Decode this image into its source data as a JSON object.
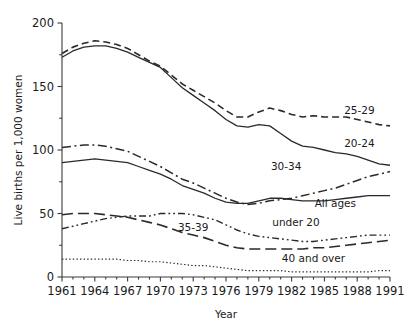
{
  "chart_data": {
    "type": "line",
    "title": "",
    "xlabel": "Year",
    "ylabel": "Live births per 1,000 women",
    "xlim": [
      1961,
      1991
    ],
    "ylim": [
      0,
      200
    ],
    "yticks": [
      0,
      50,
      100,
      150,
      200
    ],
    "ytick_labels": [
      "0",
      "50",
      "100",
      "150",
      "200"
    ],
    "xticks": [
      1961,
      1964,
      1967,
      1970,
      1973,
      1976,
      1979,
      1982,
      1985,
      1988,
      1991
    ],
    "xtick_labels": [
      "1961",
      "1964",
      "1967",
      "1970",
      "1973",
      "1976",
      "1979",
      "1982",
      "1985",
      "1988",
      "1991"
    ],
    "grid": false,
    "legend_position": "inline-end-of-line",
    "x": [
      1961,
      1962,
      1963,
      1964,
      1965,
      1966,
      1967,
      1968,
      1969,
      1970,
      1971,
      1972,
      1973,
      1974,
      1975,
      1976,
      1977,
      1978,
      1979,
      1980,
      1981,
      1982,
      1983,
      1984,
      1985,
      1986,
      1987,
      1988,
      1989,
      1990,
      1991
    ],
    "series": [
      {
        "name": "25-29",
        "label": "25-29",
        "style": "dashed",
        "dasharray": "7,4",
        "width": 1.6,
        "label_xy": [
          1988.2,
          128
        ],
        "values": [
          176,
          181,
          184,
          186,
          185,
          183,
          180,
          175,
          170,
          166,
          159,
          152,
          147,
          142,
          137,
          131,
          126,
          126,
          130,
          133,
          131,
          128,
          126,
          127,
          126,
          126,
          126,
          124,
          122,
          120,
          119
        ]
      },
      {
        "name": "20-24",
        "label": "20-24",
        "style": "solid",
        "dasharray": "none",
        "width": 1.3,
        "label_xy": [
          1988.2,
          102
        ],
        "values": [
          173,
          178,
          181,
          182,
          182,
          180,
          177,
          173,
          169,
          165,
          157,
          149,
          143,
          137,
          131,
          124,
          119,
          118,
          120,
          119,
          113,
          107,
          103,
          102,
          100,
          98,
          97,
          95,
          92,
          89,
          88
        ]
      },
      {
        "name": "30-34",
        "label": "30-34",
        "style": "dashdot",
        "dasharray": "9,3.5,2,3.5",
        "width": 1.5,
        "label_xy": [
          1981.5,
          84
        ],
        "values": [
          102,
          103,
          104,
          104,
          103,
          101,
          99,
          95,
          91,
          87,
          82,
          77,
          74,
          70,
          66,
          62,
          59,
          57,
          58,
          60,
          61,
          62,
          64,
          66,
          68,
          70,
          73,
          76,
          79,
          81,
          83
        ]
      },
      {
        "name": "All ages",
        "label": "All ages",
        "style": "solid",
        "dasharray": "none",
        "width": 1.3,
        "label_xy": [
          1986.0,
          55
        ],
        "values": [
          90,
          91,
          92,
          93,
          92,
          91,
          90,
          87,
          84,
          81,
          77,
          72,
          69,
          66,
          62,
          59,
          58,
          58,
          60,
          62,
          62,
          61,
          60,
          60,
          60,
          61,
          62,
          63,
          64,
          64,
          64
        ]
      },
      {
        "name": "under 20",
        "label": "under 20",
        "style": "dashdotdot",
        "dasharray": "7,3,1.8,3,1.8,3",
        "width": 1.4,
        "label_xy": [
          1982.4,
          40
        ],
        "values": [
          38,
          40,
          42,
          44,
          46,
          47,
          48,
          48,
          48,
          50,
          50,
          50,
          49,
          47,
          45,
          41,
          37,
          34,
          32,
          31,
          30,
          29,
          28,
          28,
          29,
          30,
          31,
          32,
          33,
          33,
          33
        ]
      },
      {
        "name": "35-39",
        "label": "35-39",
        "style": "longdash",
        "dasharray": "11,5",
        "width": 1.6,
        "label_xy": [
          1973.0,
          36
        ],
        "values": [
          49,
          50,
          50,
          50,
          49,
          48,
          47,
          45,
          43,
          41,
          38,
          35,
          33,
          31,
          28,
          25,
          23,
          22,
          22,
          22,
          22,
          22,
          22,
          23,
          23,
          24,
          25,
          26,
          27,
          28,
          29
        ]
      },
      {
        "name": "40 and over",
        "label": "40 and over",
        "style": "dotted",
        "dasharray": "1.4,2.2",
        "width": 1.2,
        "label_xy": [
          1984.0,
          12
        ],
        "values": [
          14,
          14,
          14,
          14,
          14,
          14,
          13,
          13,
          12,
          12,
          11,
          10,
          9,
          9,
          8,
          7,
          6,
          5,
          5,
          5,
          5,
          4,
          4,
          4,
          4,
          4,
          4,
          4,
          4,
          5,
          5
        ]
      }
    ]
  }
}
